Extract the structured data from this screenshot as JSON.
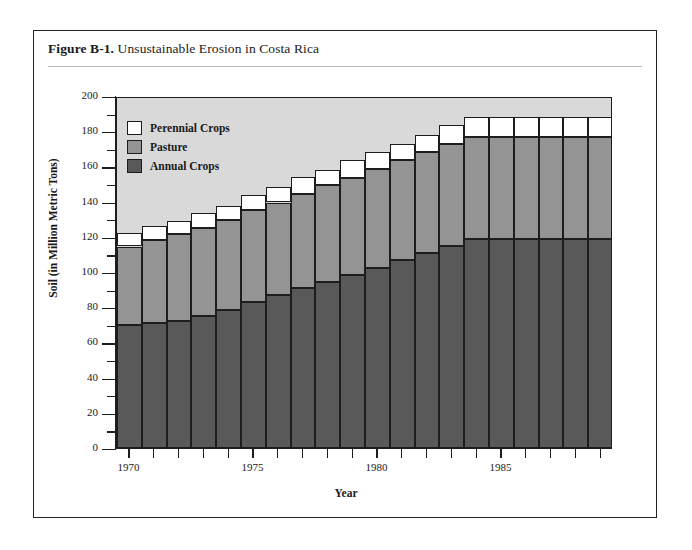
{
  "figure": {
    "label": "Figure B-1.",
    "title": "Unsustainable Erosion in Costa Rica"
  },
  "chart_data": {
    "type": "bar",
    "subtype": "stacked-vertical",
    "title": "Unsustainable Erosion in Costa Rica",
    "xlabel": "Year",
    "ylabel": "Soil (in Million Metric Tons)",
    "ylim": [
      0,
      200
    ],
    "ytick_step": 20,
    "yminor_step": 10,
    "grid": false,
    "legend_position": "top-left-inside",
    "categories": [
      "1970",
      "1971",
      "1972",
      "1973",
      "1974",
      "1975",
      "1976",
      "1977",
      "1978",
      "1979",
      "1980",
      "1981",
      "1982",
      "1983",
      "1984",
      "1985",
      "1986",
      "1987",
      "1988",
      "1989"
    ],
    "xtick_labels": [
      "1970",
      "1975",
      "1980",
      "1985"
    ],
    "xtick_label_indices": [
      0,
      5,
      10,
      15
    ],
    "series": [
      {
        "name": "Annual Crops",
        "color": "#595959",
        "values": [
          70,
          71,
          72,
          75,
          78.5,
          83,
          87,
          91,
          94.5,
          98.5,
          102.5,
          107,
          111,
          115,
          119,
          119,
          119,
          119,
          119,
          119
        ]
      },
      {
        "name": "Pasture",
        "color": "#949494",
        "values": [
          44.5,
          47,
          49.5,
          50,
          51,
          52,
          52.5,
          53.5,
          55,
          55,
          56,
          56.5,
          57,
          58,
          57.5,
          57.5,
          57.5,
          57.5,
          57.5,
          57.5
        ]
      },
      {
        "name": "Perennial Crops",
        "color": "#ffffff",
        "values": [
          7.5,
          8,
          7.5,
          8.5,
          8,
          8.5,
          9,
          9.5,
          8.5,
          10,
          9.5,
          9.5,
          10,
          10.5,
          11.5,
          11.5,
          11.5,
          11.5,
          11.5,
          11.5
        ]
      }
    ],
    "totals": [
      122,
      126,
      129,
      133.5,
      137.5,
      143.5,
      148.5,
      154,
      158,
      163.5,
      168,
      173,
      178,
      183.5,
      188,
      188,
      188,
      188,
      188,
      188
    ],
    "plot_background": "#d9d9d9",
    "axis_color": "#1d1d1d"
  },
  "legend": {
    "items": [
      {
        "label": "Perennial Crops",
        "color": "#ffffff"
      },
      {
        "label": "Pasture",
        "color": "#949494"
      },
      {
        "label": "Annual Crops",
        "color": "#595959"
      }
    ]
  }
}
